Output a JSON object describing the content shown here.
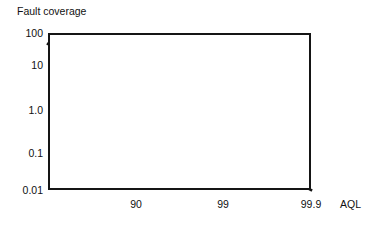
{
  "chart_data": {
    "type": "line",
    "title": "",
    "ylabel": "Fault coverage",
    "xlabel": "AQL",
    "grid": true,
    "legend": "none",
    "yscale": "log",
    "y_tick_labels": [
      "100",
      "10",
      "1.0",
      "0.1",
      "0.01"
    ],
    "y_tick_values": [
      100,
      10,
      1.0,
      0.1,
      0.01
    ],
    "ylim": [
      0.01,
      100
    ],
    "x_tick_labels": [
      "90",
      "99",
      "99.9"
    ],
    "x_tick_values": [
      90,
      99,
      99.9
    ],
    "xlim_labels": [
      "",
      "99.9"
    ],
    "series": [
      {
        "name": "fault-coverage-vs-aql",
        "points": [
          {
            "x_frac": 0.0,
            "y_value": 40
          },
          {
            "x_frac": 1.0,
            "y_value": 0.01
          }
        ],
        "color": "#151515",
        "width_px": 2.6
      }
    ],
    "gridline_color": "#9a9a9a",
    "frame_color": "#151515",
    "background": "#ffffff"
  },
  "geometry": {
    "plot_left": 48,
    "plot_top": 33,
    "plot_width": 263,
    "plot_height": 157,
    "y_tick_px": [
      0,
      32,
      77,
      120,
      157
    ],
    "x_tick_px": [
      88,
      175,
      263
    ],
    "line_start_px": {
      "x": 0,
      "y": 11
    },
    "line_end_px": {
      "x": 263,
      "y": 157
    }
  }
}
